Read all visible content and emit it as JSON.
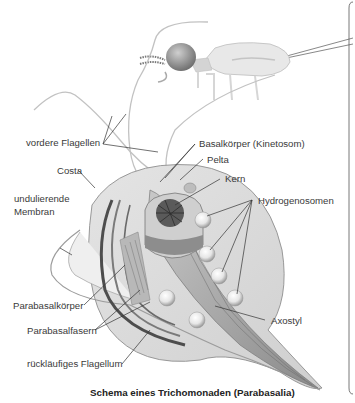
{
  "figure": {
    "caption": "Schema eines Trichomonaden (Parabasalia)",
    "organism_context": "termite",
    "labels": {
      "anterior_flagella": "vordere Flagellen",
      "basal_body": "Basalkörper (Kinetosom)",
      "pelta": "Pelta",
      "costa": "Costa",
      "nucleus": "Kern",
      "undulating_membrane_line1": "undulierende",
      "undulating_membrane_line2": "Membran",
      "hydrogenosomes": "Hydrogenosomen",
      "parabasal_body": "Parabasalkörper",
      "parabasal_fibers": "Parabasalfasern",
      "axostyle": "Axostyl",
      "recurrent_flagellum": "rückläufiges Flagellum"
    },
    "colors": {
      "background": "#ffffff",
      "cell_fill": "#d9d9d9",
      "cell_dark": "#6b6b6b",
      "text": "#3a3a3a",
      "leader_line": "#333333"
    }
  }
}
